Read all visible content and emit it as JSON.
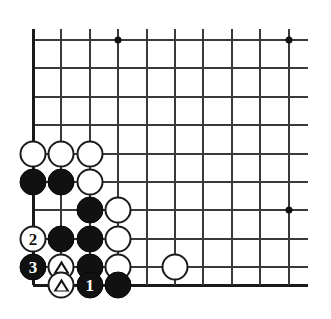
{
  "figure": {
    "kind": "go-board-diagram",
    "board": {
      "columns": 10,
      "rows": 9,
      "origin_x": 33,
      "origin_y": 40,
      "col_spacing": 28.4,
      "row_spacing": 28.4,
      "bottom_edge_y": 285,
      "left_edge_x": 33,
      "line_overhang_right": 19,
      "line_color": "#3a3a3a",
      "edge_color": "#1a1a1a",
      "background": "#ffffff"
    },
    "star_points": [
      {
        "name": "star-point-top-left",
        "col": 3,
        "row": 0
      },
      {
        "name": "star-point-top-right",
        "col": 9,
        "row": 0
      },
      {
        "name": "star-point-right",
        "col": 9,
        "row": 6
      }
    ],
    "stones": [
      {
        "name": "white-stone-a1",
        "color": "white",
        "col": 0,
        "row": 4,
        "mark": "",
        "label": ""
      },
      {
        "name": "white-stone-b1",
        "color": "white",
        "col": 1,
        "row": 4,
        "mark": "",
        "label": ""
      },
      {
        "name": "white-stone-c1",
        "color": "white",
        "col": 2,
        "row": 4,
        "mark": "",
        "label": ""
      },
      {
        "name": "black-stone-a2",
        "color": "black",
        "col": 0,
        "row": 5,
        "mark": "",
        "label": ""
      },
      {
        "name": "black-stone-b2",
        "color": "black",
        "col": 1,
        "row": 5,
        "mark": "",
        "label": ""
      },
      {
        "name": "white-stone-c2",
        "color": "white",
        "col": 2,
        "row": 5,
        "mark": "",
        "label": ""
      },
      {
        "name": "black-stone-c3",
        "color": "black",
        "col": 2,
        "row": 6,
        "mark": "",
        "label": ""
      },
      {
        "name": "white-stone-d3",
        "color": "white",
        "col": 3,
        "row": 6,
        "mark": "",
        "label": ""
      },
      {
        "name": "white-stone-move-2",
        "color": "white",
        "col": 0,
        "row": 7,
        "mark": "number",
        "label": "2"
      },
      {
        "name": "black-stone-b4",
        "color": "black",
        "col": 1,
        "row": 7,
        "mark": "",
        "label": ""
      },
      {
        "name": "black-stone-c4",
        "color": "black",
        "col": 2,
        "row": 7,
        "mark": "",
        "label": ""
      },
      {
        "name": "white-stone-d4",
        "color": "white",
        "col": 3,
        "row": 7,
        "mark": "",
        "label": ""
      },
      {
        "name": "black-stone-move-3",
        "color": "black",
        "col": 0,
        "row": 8,
        "mark": "number",
        "label": "3"
      },
      {
        "name": "white-stone-triangle-b5",
        "color": "white",
        "col": 1,
        "row": 8,
        "mark": "triangle",
        "label": ""
      },
      {
        "name": "black-stone-c5",
        "color": "black",
        "col": 2,
        "row": 8,
        "mark": "",
        "label": ""
      },
      {
        "name": "white-stone-d5",
        "color": "white",
        "col": 3,
        "row": 8,
        "mark": "",
        "label": ""
      },
      {
        "name": "white-stone-f5",
        "color": "white",
        "col": 5,
        "row": 8,
        "mark": "",
        "label": ""
      },
      {
        "name": "white-stone-triangle-b6",
        "color": "white",
        "col": 1,
        "row": 9,
        "mark": "triangle",
        "label": ""
      },
      {
        "name": "black-stone-move-1",
        "color": "black",
        "col": 2,
        "row": 9,
        "mark": "number",
        "label": "1"
      },
      {
        "name": "black-stone-d6",
        "color": "black",
        "col": 3,
        "row": 9,
        "mark": "",
        "label": ""
      }
    ]
  }
}
